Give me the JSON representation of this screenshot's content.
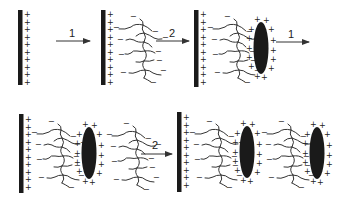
{
  "diagram": {
    "steps": [
      {
        "id": "step-1",
        "label": "1"
      },
      {
        "id": "step-2",
        "label": "2"
      },
      {
        "id": "step-1-repeat",
        "label": "1"
      },
      {
        "id": "step-2-repeat",
        "label": "2"
      }
    ],
    "charges": {
      "positive": "+",
      "negative": "−"
    },
    "colors": {
      "substrate": "#1a1a1a",
      "particle": "#1a1a1a",
      "lines": "#333333",
      "background": "#ffffff"
    }
  }
}
